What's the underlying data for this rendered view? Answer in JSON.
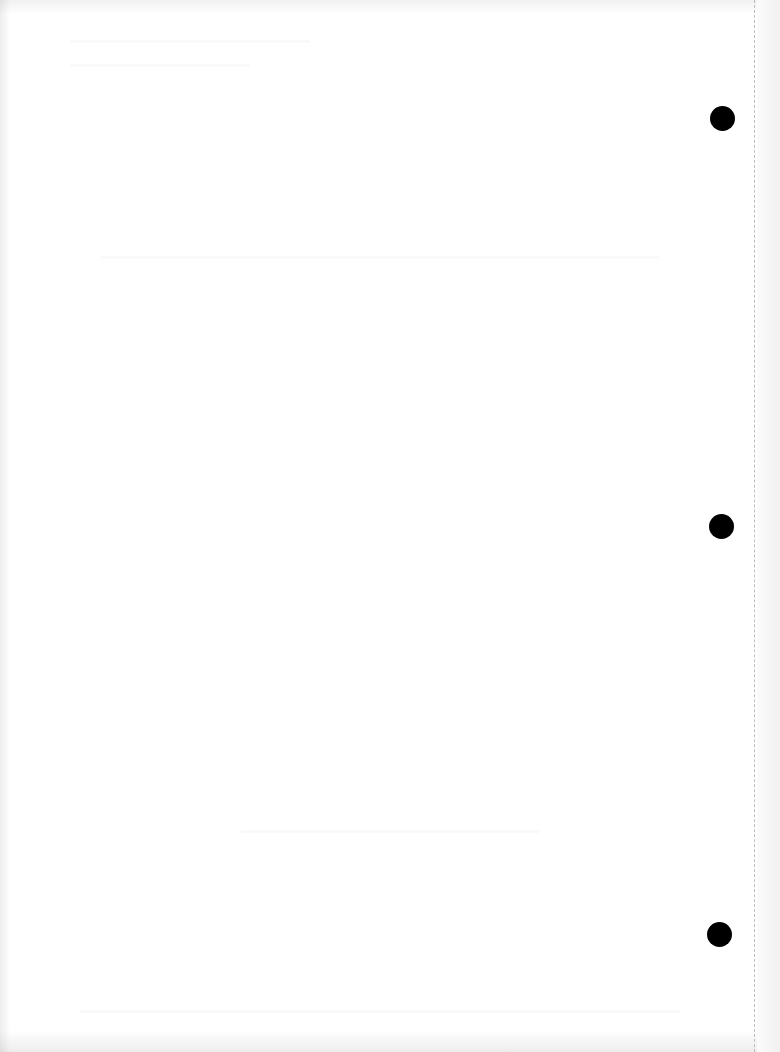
{
  "document": {
    "type": "blank scanned page",
    "text_content": "",
    "background_color": "#ffffff"
  },
  "punch_holes": [
    {
      "cx": 723,
      "cy": 119,
      "diameter": 25,
      "color": "#000000"
    },
    {
      "cx": 722,
      "cy": 527,
      "diameter": 25,
      "color": "#000000"
    },
    {
      "cx": 720,
      "cy": 935,
      "diameter": 25,
      "color": "#000000"
    }
  ],
  "perforation_line": {
    "x": 754,
    "style": "dashed",
    "color": "#bdbdbd"
  }
}
